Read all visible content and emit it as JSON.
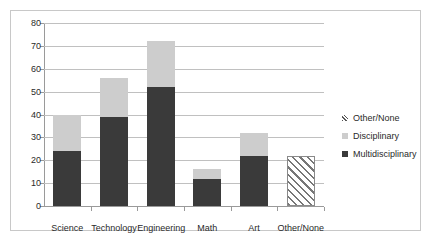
{
  "chart_data": {
    "type": "bar",
    "stacked": true,
    "title": "",
    "xlabel": "",
    "ylabel": "",
    "ylim": [
      0,
      80
    ],
    "ytick_step": 10,
    "yticks": [
      0,
      10,
      20,
      30,
      40,
      50,
      60,
      70,
      80
    ],
    "ytick_labels": [
      "0",
      "10",
      "20",
      "30",
      "40",
      "50",
      "60",
      "70",
      "80"
    ],
    "grid": true,
    "grid_axis": "y",
    "legend_position": "right",
    "categories": [
      "Science",
      "Technology",
      "Engineering",
      "Math",
      "Art",
      "Other/None"
    ],
    "series": [
      {
        "name": "Multidisciplinary",
        "color": "#3a3a3a",
        "pattern": "solid",
        "values": [
          24,
          39,
          52,
          12,
          22,
          0
        ]
      },
      {
        "name": "Disciplinary",
        "color": "#cdcdcd",
        "pattern": "solid",
        "values": [
          16,
          17,
          20,
          4,
          10,
          0
        ]
      },
      {
        "name": "Other/None",
        "color": "#ffffff",
        "pattern": "diagonal-hatch",
        "values": [
          0,
          0,
          0,
          0,
          0,
          22
        ]
      }
    ],
    "totals": [
      40,
      56,
      72,
      16,
      32,
      22
    ],
    "legend_entries": [
      {
        "label": "Other/None",
        "swatch": "hatch"
      },
      {
        "label": "Disciplinary",
        "swatch": "light-gray"
      },
      {
        "label": "Multidisciplinary",
        "swatch": "dark-gray"
      }
    ]
  }
}
